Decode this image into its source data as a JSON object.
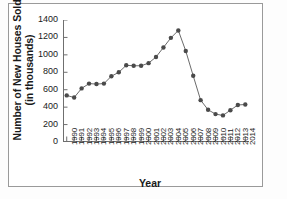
{
  "chart_data": {
    "type": "line",
    "title": "",
    "xlabel": "Year",
    "ylabel": "Number of New Houses Sold (in thousands)",
    "ylabel_line1": "Number of New Houses Sold",
    "ylabel_line2": "(in thousands)",
    "xlim": [
      1989.5,
      2014.5
    ],
    "ylim": [
      0,
      1400
    ],
    "yticks": [
      0,
      200,
      400,
      600,
      800,
      1000,
      1200,
      1400
    ],
    "ytick_labels": [
      "0",
      "200",
      "400",
      "600",
      "800",
      "1000",
      "1200",
      "1400"
    ],
    "grid": false,
    "legend": "none",
    "marker": "filled-circle",
    "marker_color": "#4a4a4a",
    "line_color": "#6b6b6b",
    "categories": [
      "1990",
      "1991",
      "1992",
      "1993",
      "1994",
      "1995",
      "1996",
      "1997",
      "1998",
      "1999",
      "2000",
      "2001",
      "2002",
      "2003",
      "2004",
      "2005",
      "2006",
      "2007",
      "2008",
      "2009",
      "2010",
      "2011",
      "2012",
      "2013",
      "2014"
    ],
    "x": [
      1990,
      1991,
      1992,
      1993,
      1994,
      1995,
      1996,
      1997,
      1998,
      1999,
      2000,
      2001,
      2002,
      2003,
      2004,
      2005,
      2006,
      2007,
      2008,
      2009,
      2010,
      2011,
      2012,
      2013,
      2014
    ],
    "values": [
      535,
      510,
      615,
      670,
      665,
      670,
      755,
      800,
      880,
      875,
      875,
      905,
      975,
      1085,
      1195,
      1280,
      1045,
      760,
      480,
      370,
      320,
      305,
      365,
      425,
      430
    ],
    "series": [
      {
        "name": "New Houses Sold",
        "values": [
          535,
          510,
          615,
          670,
          665,
          670,
          755,
          800,
          880,
          875,
          875,
          905,
          975,
          1085,
          1195,
          1280,
          1045,
          760,
          480,
          370,
          320,
          305,
          365,
          425,
          430
        ]
      }
    ]
  }
}
